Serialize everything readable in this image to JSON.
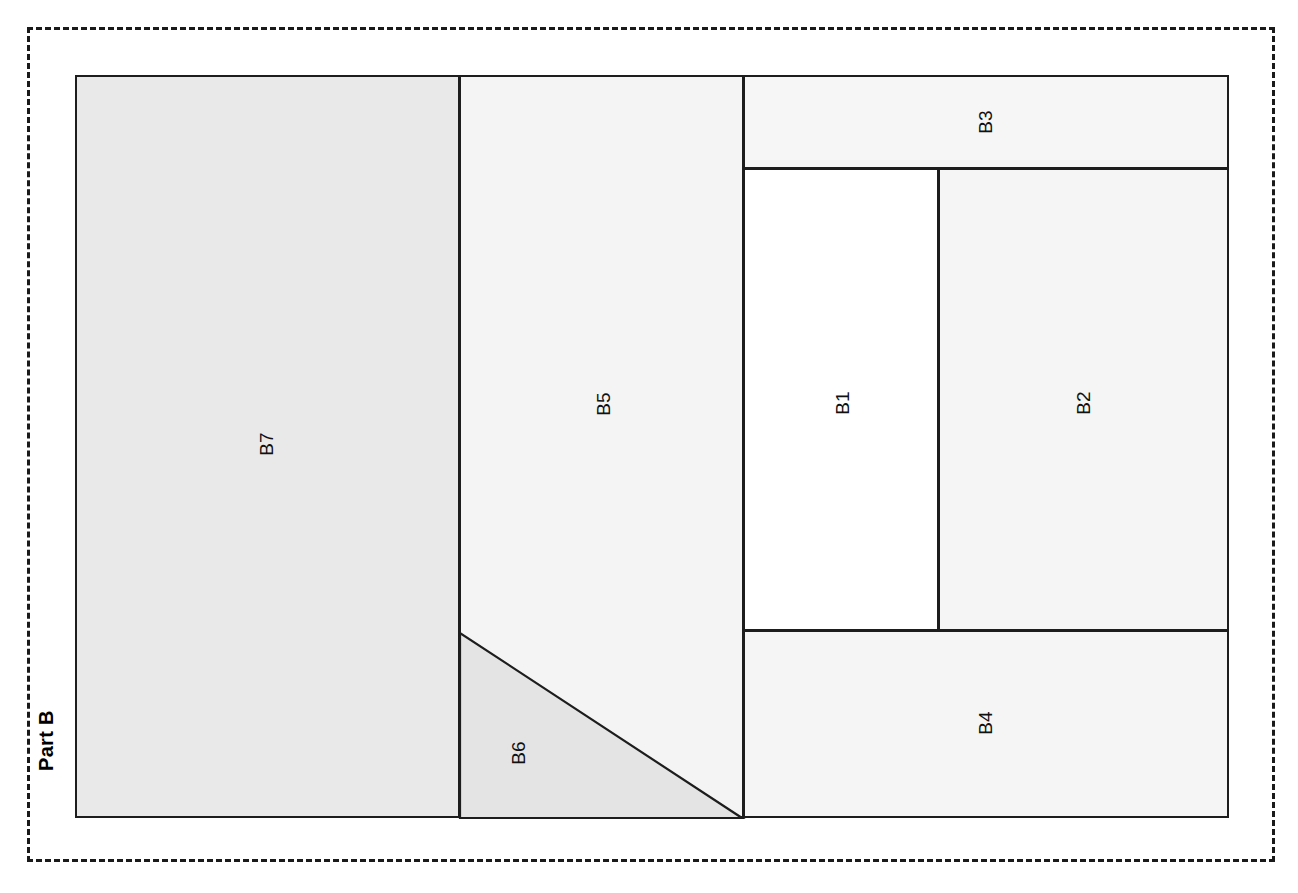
{
  "figure": {
    "part_label": "Part B",
    "background_color": "#ffffff",
    "frame_color": "#1a1a1a",
    "line_color": "#1d1d1d"
  },
  "regions": [
    {
      "id": "B7",
      "label": "B7",
      "shape": "rectangle",
      "fill": "#e9e9e9",
      "x": 75,
      "y": 75,
      "w": 385,
      "h": 743,
      "label_x": 267,
      "label_y": 444
    },
    {
      "id": "B5",
      "label": "B5",
      "shape": "polygon",
      "fill": "#f4f4f4",
      "x": 459,
      "y": 75,
      "w": 285,
      "h": 743,
      "label_x": 604,
      "label_y": 404
    },
    {
      "id": "B6",
      "label": "B6",
      "shape": "triangle",
      "fill": "#e4e4e4",
      "points": "460,633 460,818 742,818",
      "label_x": 519,
      "label_y": 753
    },
    {
      "id": "B3",
      "label": "B3",
      "shape": "rectangle",
      "fill": "#f6f6f6",
      "x": 743,
      "y": 75,
      "w": 486,
      "h": 94,
      "label_x": 986,
      "label_y": 122
    },
    {
      "id": "B1",
      "label": "B1",
      "shape": "rectangle",
      "fill": "#ffffff",
      "x": 743,
      "y": 168,
      "w": 196,
      "h": 463,
      "label_x": 843,
      "label_y": 403
    },
    {
      "id": "B2",
      "label": "B2",
      "shape": "rectangle",
      "fill": "#f5f5f5",
      "x": 938,
      "y": 168,
      "w": 291,
      "h": 463,
      "label_x": 1084,
      "label_y": 403
    },
    {
      "id": "B4",
      "label": "B4",
      "shape": "rectangle",
      "fill": "#f5f5f5",
      "x": 743,
      "y": 630,
      "w": 486,
      "h": 188,
      "label_x": 986,
      "label_y": 723
    }
  ]
}
